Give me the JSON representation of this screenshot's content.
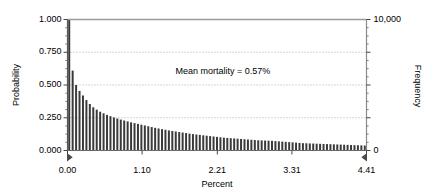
{
  "chart_data": {
    "type": "bar",
    "title": "",
    "subtitle": "",
    "xlabel": "Percent",
    "ylabel": "Probability",
    "ylabel_right": "Frequency",
    "xlim": [
      0.0,
      4.41
    ],
    "ylim": [
      0.0,
      1.0
    ],
    "ylim_right": [
      0,
      10000
    ],
    "grid": true,
    "grid_axis": "y",
    "legend": null,
    "bar_color": "#3a3a3a",
    "frame_color": "#808080",
    "annotations": [
      {
        "text": "Mean mortality = 0.57%",
        "x_frac": 0.52,
        "y_frac": 0.6
      }
    ],
    "markers": [
      {
        "name": "left-range-marker",
        "shape": "triangle-right",
        "x": 0.0
      },
      {
        "name": "right-range-marker",
        "shape": "triangle-left",
        "x": 4.41
      }
    ],
    "xticks": [
      0.0,
      1.1,
      2.21,
      3.31,
      4.41
    ],
    "xtick_labels": [
      "0.00",
      "1.10",
      "2.21",
      "3.31",
      "4.41"
    ],
    "yticks": [
      0.0,
      0.25,
      0.5,
      0.75,
      1.0
    ],
    "ytick_labels": [
      "0.000",
      "0.250",
      "0.500",
      "0.750",
      "1.000"
    ],
    "yticks_right": [
      0,
      10000
    ],
    "ytick_labels_right": [
      "0",
      "10,000"
    ],
    "yminor_count": 4,
    "categories": [
      0.03,
      0.08,
      0.13,
      0.18,
      0.23,
      0.28,
      0.33,
      0.38,
      0.43,
      0.48,
      0.54,
      0.59,
      0.64,
      0.69,
      0.74,
      0.79,
      0.84,
      0.89,
      0.94,
      0.99,
      1.05,
      1.1,
      1.15,
      1.2,
      1.25,
      1.3,
      1.35,
      1.4,
      1.45,
      1.5,
      1.56,
      1.61,
      1.66,
      1.71,
      1.76,
      1.81,
      1.86,
      1.91,
      1.96,
      2.01,
      2.07,
      2.12,
      2.17,
      2.22,
      2.27,
      2.32,
      2.37,
      2.42,
      2.47,
      2.52,
      2.58,
      2.63,
      2.68,
      2.73,
      2.78,
      2.83,
      2.88,
      2.93,
      2.98,
      3.03,
      3.09,
      3.14,
      3.19,
      3.24,
      3.29,
      3.34,
      3.39,
      3.44,
      3.49,
      3.54,
      3.6,
      3.65,
      3.7,
      3.75,
      3.8,
      3.85,
      3.9,
      3.95,
      4.0,
      4.05,
      4.11,
      4.16,
      4.21,
      4.26,
      4.31,
      4.36,
      4.41
    ],
    "values": [
      1.0,
      0.61,
      0.5,
      0.455,
      0.42,
      0.385,
      0.355,
      0.33,
      0.312,
      0.296,
      0.284,
      0.272,
      0.262,
      0.252,
      0.244,
      0.236,
      0.229,
      0.222,
      0.215,
      0.209,
      0.203,
      0.197,
      0.191,
      0.185,
      0.179,
      0.173,
      0.168,
      0.163,
      0.158,
      0.153,
      0.149,
      0.145,
      0.141,
      0.137,
      0.133,
      0.129,
      0.125,
      0.122,
      0.119,
      0.116,
      0.113,
      0.11,
      0.107,
      0.104,
      0.101,
      0.098,
      0.096,
      0.094,
      0.092,
      0.09,
      0.088,
      0.086,
      0.084,
      0.082,
      0.08,
      0.078,
      0.077,
      0.076,
      0.075,
      0.074,
      0.072,
      0.07,
      0.068,
      0.066,
      0.064,
      0.062,
      0.06,
      0.058,
      0.056,
      0.055,
      0.054,
      0.053,
      0.052,
      0.051,
      0.05,
      0.049,
      0.048,
      0.047,
      0.046,
      0.045,
      0.044,
      0.043,
      0.042,
      0.041,
      0.04,
      0.039,
      0.038
    ]
  }
}
